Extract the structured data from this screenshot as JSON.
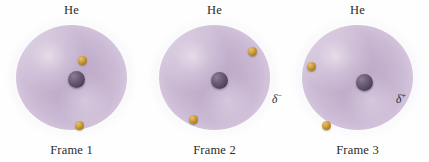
{
  "figure": {
    "background_color": "#ffffff",
    "cloud_color": "#c5b1cf",
    "nucleus_color": "#574a62",
    "electron_color": "#cfa23f",
    "text_color": "#2b2b2b"
  },
  "frames": [
    {
      "atom_label": "He",
      "frame_label": "Frame 1",
      "nucleus": {
        "x": 52,
        "y": 46
      },
      "electrons": [
        {
          "x": 62,
          "y": 31
        },
        {
          "x": 59,
          "y": 96
        }
      ],
      "charge_labels": []
    },
    {
      "atom_label": "He",
      "frame_label": "Frame 2",
      "nucleus": {
        "x": 52,
        "y": 47
      },
      "electrons": [
        {
          "x": 89,
          "y": 22
        },
        {
          "x": 30,
          "y": 90
        }
      ],
      "charge_labels": []
    },
    {
      "atom_label": "He",
      "frame_label": "Frame 3",
      "nucleus": {
        "x": 54,
        "y": 49
      },
      "electrons": [
        {
          "x": 5,
          "y": 37
        },
        {
          "x": 20,
          "y": 96
        }
      ],
      "charge_labels": [
        {
          "name": "delta-minus",
          "symbol": "δ",
          "sign": "−"
        },
        {
          "name": "delta-plus",
          "symbol": "δ",
          "sign": "+"
        }
      ]
    }
  ]
}
